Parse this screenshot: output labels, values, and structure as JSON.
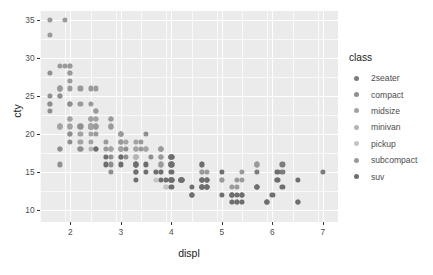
{
  "chart_data": {
    "type": "scatter",
    "title": "",
    "xlabel": "displ",
    "ylabel": "cty",
    "xlim": [
      1.4,
      7.3
    ],
    "ylim": [
      8.4,
      36.2
    ],
    "xticks": [
      "2",
      "3",
      "4",
      "5",
      "6",
      "7"
    ],
    "xtick_values": [
      2,
      3,
      4,
      5,
      6,
      7
    ],
    "yticks": [
      "10",
      "15",
      "20",
      "25",
      "30",
      "35"
    ],
    "ytick_values": [
      10,
      15,
      20,
      25,
      30,
      35
    ],
    "grid": true,
    "panel_background": "#ebebeb",
    "grid_color": "#ffffff",
    "legend": {
      "title": "class",
      "position": "right",
      "entries": [
        {
          "label": "2seater",
          "color": "#7c7c7c"
        },
        {
          "label": "compact",
          "color": "#8f8f8f"
        },
        {
          "label": "midsize",
          "color": "#a3a3a3"
        },
        {
          "label": "minivan",
          "color": "#b5b5b5"
        },
        {
          "label": "pickup",
          "color": "#c4c4c4"
        },
        {
          "label": "subcompact",
          "color": "#9a9a9a"
        },
        {
          "label": "suv",
          "color": "#6e6e6e"
        }
      ]
    },
    "series": [
      {
        "name": "2seater",
        "color": "#7c7c7c",
        "points": [
          [
            5.7,
            16
          ],
          [
            5.7,
            15
          ],
          [
            6.2,
            16
          ],
          [
            6.2,
            15
          ],
          [
            7.0,
            15
          ]
        ]
      },
      {
        "name": "compact",
        "color": "#8f8f8f",
        "points": [
          [
            1.8,
            18
          ],
          [
            1.8,
            21
          ],
          [
            2.0,
            20
          ],
          [
            2.0,
            21
          ],
          [
            2.8,
            16
          ],
          [
            2.8,
            18
          ],
          [
            3.1,
            18
          ],
          [
            1.8,
            18
          ],
          [
            1.8,
            16
          ],
          [
            2.0,
            20
          ],
          [
            2.0,
            19
          ],
          [
            2.8,
            15
          ],
          [
            2.8,
            17
          ],
          [
            3.1,
            17
          ],
          [
            2.4,
            21
          ],
          [
            2.4,
            22
          ],
          [
            2.4,
            21
          ],
          [
            2.4,
            21
          ],
          [
            3.0,
            18
          ],
          [
            3.0,
            18
          ],
          [
            3.3,
            18
          ],
          [
            1.8,
            26
          ],
          [
            1.8,
            25
          ],
          [
            2.0,
            24
          ],
          [
            2.0,
            24
          ],
          [
            2.8,
            21
          ],
          [
            2.8,
            22
          ],
          [
            3.6,
            17
          ],
          [
            1.6,
            28
          ],
          [
            1.6,
            24
          ],
          [
            1.6,
            25
          ],
          [
            1.6,
            23
          ],
          [
            1.6,
            24
          ],
          [
            1.8,
            26
          ],
          [
            1.8,
            25
          ],
          [
            2.0,
            24
          ],
          [
            2.4,
            21
          ],
          [
            2.4,
            22
          ],
          [
            2.5,
            23
          ],
          [
            2.5,
            22
          ],
          [
            2.2,
            21
          ],
          [
            2.2,
            21
          ],
          [
            2.4,
            21
          ],
          [
            2.4,
            21
          ],
          [
            3.0,
            20
          ],
          [
            3.0,
            19
          ],
          [
            3.5,
            20
          ],
          [
            2.2,
            18
          ],
          [
            2.2,
            18
          ]
        ]
      },
      {
        "name": "midsize",
        "color": "#a3a3a3",
        "points": [
          [
            2.4,
            21
          ],
          [
            2.4,
            21
          ],
          [
            3.1,
            19
          ],
          [
            2.0,
            21
          ],
          [
            2.0,
            22
          ],
          [
            2.8,
            18
          ],
          [
            2.8,
            18
          ],
          [
            3.3,
            17
          ],
          [
            3.3,
            17
          ],
          [
            3.8,
            18
          ],
          [
            3.8,
            18
          ],
          [
            3.8,
            17
          ],
          [
            2.4,
            19
          ],
          [
            2.4,
            21
          ],
          [
            2.5,
            21
          ],
          [
            2.5,
            22
          ],
          [
            3.0,
            18
          ],
          [
            3.0,
            18
          ],
          [
            3.5,
            18
          ],
          [
            3.5,
            18
          ],
          [
            2.2,
            19
          ],
          [
            2.2,
            20
          ],
          [
            2.4,
            21
          ],
          [
            2.4,
            20
          ],
          [
            3.0,
            17
          ],
          [
            3.0,
            18
          ],
          [
            3.5,
            18
          ],
          [
            2.4,
            21
          ],
          [
            2.4,
            22
          ],
          [
            3.0,
            19
          ],
          [
            3.0,
            20
          ],
          [
            3.3,
            19
          ],
          [
            3.3,
            18
          ],
          [
            3.8,
            18
          ],
          [
            3.8,
            18
          ],
          [
            4.0,
            17
          ],
          [
            1.8,
            21
          ],
          [
            1.8,
            21
          ],
          [
            2.0,
            22
          ],
          [
            2.0,
            22
          ]
        ]
      },
      {
        "name": "minivan",
        "color": "#b5b5b5",
        "points": [
          [
            2.4,
            18
          ],
          [
            3.0,
            17
          ],
          [
            3.3,
            16
          ],
          [
            3.3,
            17
          ],
          [
            3.8,
            15
          ],
          [
            3.8,
            17
          ],
          [
            3.8,
            16
          ],
          [
            4.0,
            14
          ],
          [
            3.3,
            17
          ],
          [
            3.3,
            17
          ],
          [
            3.8,
            16
          ]
        ]
      },
      {
        "name": "pickup",
        "color": "#c4c4c4",
        "points": [
          [
            3.7,
            15
          ],
          [
            3.7,
            14
          ],
          [
            3.9,
            13
          ],
          [
            3.9,
            14
          ],
          [
            4.7,
            14
          ],
          [
            4.7,
            14
          ],
          [
            4.7,
            13
          ],
          [
            5.2,
            12
          ],
          [
            5.2,
            11
          ],
          [
            3.9,
            13
          ],
          [
            4.7,
            13
          ],
          [
            4.7,
            14
          ],
          [
            5.2,
            12
          ],
          [
            5.7,
            13
          ],
          [
            5.9,
            11
          ],
          [
            4.6,
            13
          ],
          [
            5.4,
            12
          ],
          [
            5.4,
            12
          ],
          [
            4.0,
            16
          ],
          [
            4.0,
            16
          ],
          [
            4.6,
            15
          ],
          [
            5.0,
            14
          ],
          [
            4.2,
            14
          ],
          [
            4.2,
            14
          ],
          [
            4.6,
            13
          ],
          [
            4.6,
            13
          ],
          [
            4.6,
            14
          ],
          [
            5.4,
            12
          ],
          [
            5.4,
            11
          ],
          [
            4.0,
            16
          ],
          [
            4.0,
            16
          ],
          [
            4.6,
            15
          ],
          [
            5.0,
            14
          ]
        ]
      },
      {
        "name": "subcompact",
        "color": "#9a9a9a",
        "points": [
          [
            1.6,
            33
          ],
          [
            1.6,
            35
          ],
          [
            1.8,
            29
          ],
          [
            1.8,
            26
          ],
          [
            2.0,
            26
          ],
          [
            2.0,
            28
          ],
          [
            2.2,
            26
          ],
          [
            2.2,
            24
          ],
          [
            2.4,
            24
          ],
          [
            2.4,
            26
          ],
          [
            2.5,
            26
          ],
          [
            2.5,
            23
          ],
          [
            2.8,
            22
          ],
          [
            2.8,
            21
          ],
          [
            3.0,
            20
          ],
          [
            3.0,
            20
          ],
          [
            3.4,
            19
          ],
          [
            3.4,
            18
          ],
          [
            3.8,
            18
          ],
          [
            3.8,
            18
          ],
          [
            4.0,
            17
          ],
          [
            4.0,
            17
          ],
          [
            4.6,
            15
          ],
          [
            4.6,
            16
          ],
          [
            5.4,
            15
          ],
          [
            5.4,
            14
          ],
          [
            1.9,
            35
          ],
          [
            1.9,
            29
          ],
          [
            2.0,
            28
          ],
          [
            2.0,
            29
          ],
          [
            2.5,
            21
          ],
          [
            2.5,
            20
          ],
          [
            2.7,
            19
          ],
          [
            2.7,
            18
          ],
          [
            3.0,
            19
          ],
          [
            3.0,
            20
          ],
          [
            3.8,
            17
          ],
          [
            3.8,
            16
          ],
          [
            4.7,
            15
          ],
          [
            4.7,
            14
          ],
          [
            5.0,
            14
          ],
          [
            5.2,
            13
          ],
          [
            5.3,
            14
          ],
          [
            5.3,
            13
          ],
          [
            5.7,
            16
          ],
          [
            6.1,
            14
          ],
          [
            2.0,
            27
          ],
          [
            2.0,
            29
          ],
          [
            2.5,
            21
          ]
        ]
      },
      {
        "name": "suv",
        "color": "#6e6e6e",
        "points": [
          [
            4.0,
            14
          ],
          [
            4.0,
            14
          ],
          [
            4.6,
            13
          ],
          [
            4.6,
            13
          ],
          [
            4.6,
            14
          ],
          [
            4.6,
            14
          ],
          [
            5.4,
            12
          ],
          [
            5.4,
            11
          ],
          [
            5.4,
            12
          ],
          [
            3.3,
            16
          ],
          [
            3.8,
            14
          ],
          [
            3.8,
            15
          ],
          [
            4.0,
            13
          ],
          [
            4.0,
            14
          ],
          [
            4.2,
            14
          ],
          [
            4.4,
            12
          ],
          [
            4.6,
            14
          ],
          [
            4.6,
            13
          ],
          [
            5.0,
            12
          ],
          [
            5.3,
            12
          ],
          [
            5.3,
            11
          ],
          [
            5.3,
            11
          ],
          [
            5.7,
            13
          ],
          [
            5.9,
            11
          ],
          [
            6.0,
            12
          ],
          [
            6.2,
            13
          ],
          [
            6.5,
            11
          ],
          [
            6.5,
            11
          ],
          [
            2.5,
            18
          ],
          [
            2.5,
            18
          ],
          [
            2.7,
            17
          ],
          [
            2.7,
            16
          ],
          [
            3.0,
            17
          ],
          [
            3.0,
            16
          ],
          [
            3.5,
            16
          ],
          [
            3.5,
            15
          ],
          [
            3.7,
            15
          ],
          [
            3.9,
            14
          ],
          [
            4.0,
            14
          ],
          [
            4.0,
            15
          ],
          [
            4.2,
            14
          ],
          [
            4.4,
            13
          ],
          [
            4.6,
            13
          ],
          [
            4.7,
            13
          ],
          [
            4.7,
            13
          ],
          [
            4.7,
            14
          ],
          [
            5.2,
            12
          ],
          [
            5.2,
            11
          ],
          [
            5.7,
            13
          ],
          [
            5.9,
            11
          ],
          [
            4.7,
            14
          ],
          [
            4.7,
            13
          ],
          [
            4.7,
            13
          ],
          [
            5.2,
            12
          ],
          [
            5.2,
            12
          ],
          [
            5.7,
            13
          ],
          [
            5.9,
            11
          ],
          [
            6.1,
            14
          ],
          [
            6.1,
            15
          ],
          [
            3.3,
            15
          ],
          [
            3.3,
            16
          ],
          [
            3.3,
            16
          ],
          [
            3.3,
            15
          ],
          [
            3.3,
            14
          ],
          [
            4.0,
            17
          ],
          [
            4.0,
            16
          ],
          [
            4.0,
            17
          ],
          [
            4.0,
            16
          ],
          [
            4.6,
            16
          ],
          [
            5.0,
            15
          ],
          [
            4.2,
            14
          ],
          [
            4.2,
            14
          ],
          [
            4.4,
            12
          ],
          [
            4.4,
            12
          ],
          [
            6.5,
            14
          ]
        ]
      }
    ]
  }
}
